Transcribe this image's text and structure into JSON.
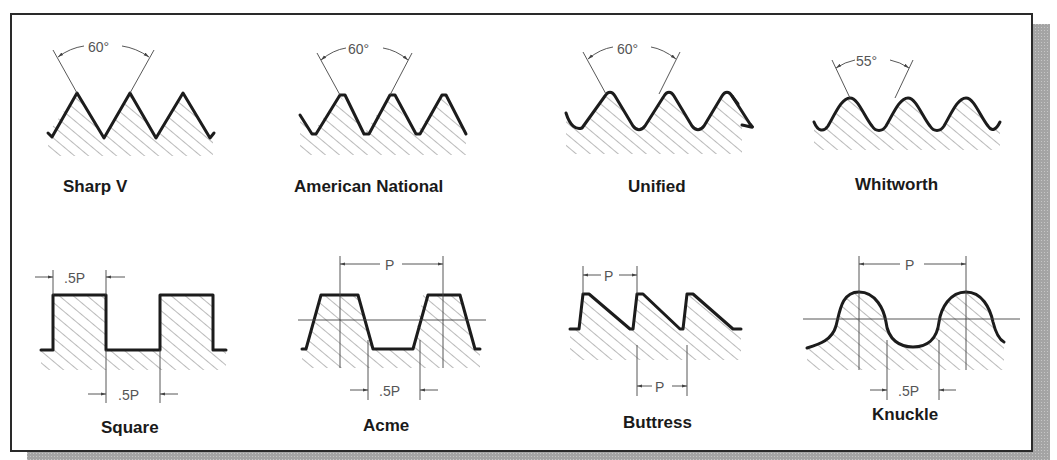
{
  "figure": {
    "colors": {
      "background": "#ffffff",
      "frame": "#2a2a2a",
      "shadow": "#a8a8a8",
      "profile": "#1c1c1c",
      "dimension": "#555555"
    },
    "threads": [
      {
        "name": "Sharp V",
        "angle_label": "60°"
      },
      {
        "name": "American National",
        "angle_label": "60°"
      },
      {
        "name": "Unified",
        "angle_label": "60°"
      },
      {
        "name": "Whitworth",
        "angle_label": "55°"
      },
      {
        "name": "Square",
        "dims": [
          ".5P",
          ".5P"
        ]
      },
      {
        "name": "Acme",
        "dims": [
          "P",
          ".5P"
        ]
      },
      {
        "name": "Buttress",
        "dims": [
          "P",
          "P"
        ]
      },
      {
        "name": "Knuckle",
        "dims": [
          "P",
          ".5P"
        ]
      }
    ]
  }
}
